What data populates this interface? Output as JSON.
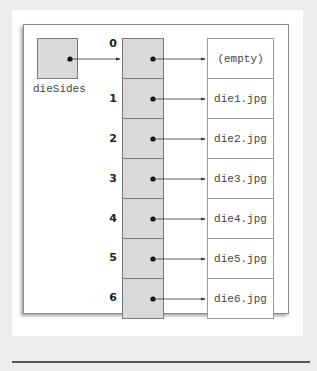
{
  "diagram": {
    "variable": {
      "name": "dieSides",
      "points_to_index": "0"
    },
    "array": {
      "indices": [
        "0",
        "1",
        "2",
        "3",
        "4",
        "5",
        "6"
      ],
      "values": [
        "(empty)",
        "die1.jpg",
        "die2.jpg",
        "die3.jpg",
        "die4.jpg",
        "die5.jpg",
        "die6.jpg"
      ]
    },
    "colors": {
      "cell_fill": "#d9d9d9",
      "cell_border": "#7a7a7a",
      "arrow": "#333333",
      "background": "#ececec"
    }
  }
}
